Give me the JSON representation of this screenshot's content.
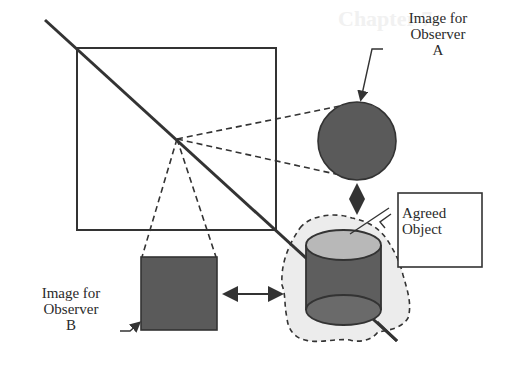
{
  "background_ghost": {
    "line1": "Chapter 7",
    "line2": "...ency ...dic"
  },
  "labels": {
    "observer_a": {
      "line1": "Image for",
      "line2": "Observer",
      "line3": "A"
    },
    "observer_b": {
      "line1": "Image for",
      "line2": "Observer",
      "line3": "B"
    },
    "agreed_object": {
      "line1": "Agreed",
      "line2": "Object"
    }
  },
  "colors": {
    "stroke": "#333333",
    "dark_fill": "#5a5a5a",
    "cylinder_top": "#b8b8b8",
    "cylinder_body": "#5e5e5e",
    "cylinder_bottom": "#6a6a6a",
    "halo_fill": "#ececec"
  },
  "diagram": {
    "frame_square": {
      "x": 77,
      "y": 48,
      "w": 199,
      "h": 182
    },
    "projection_point": {
      "x": 177,
      "y": 139
    },
    "diagonal_line": {
      "x1": 45,
      "y1": 20,
      "x2": 397,
      "y2": 341
    },
    "observer_a_image": {
      "shape": "circle",
      "cx": 357,
      "cy": 141,
      "r": 39
    },
    "observer_b_image": {
      "shape": "square",
      "x": 141,
      "y": 257,
      "w": 76,
      "h": 73
    },
    "agreed_object": {
      "shape": "cylinder",
      "x": 306,
      "top_cy": 245,
      "bottom_cy": 310,
      "w": 75,
      "ry": 15
    },
    "agreed_label_box": {
      "x": 398,
      "y": 193,
      "w": 84,
      "h": 74
    }
  }
}
